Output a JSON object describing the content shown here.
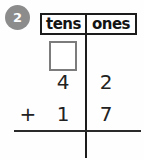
{
  "problem": {
    "number": "2",
    "operator": "+",
    "header": {
      "columns": [
        "tens",
        "ones"
      ]
    },
    "addend1": {
      "tens": "4",
      "ones": "2"
    },
    "addend2": {
      "tens": "1",
      "ones": "7"
    },
    "carry_box_value": "",
    "answer": {
      "tens": "",
      "ones": ""
    },
    "colors": {
      "badge_background": "#8c8c8c",
      "badge_text": "#ffffff",
      "line_color": "#1c1c1c",
      "carry_box_border": "#7c7c7c",
      "digit_color": "#222222"
    }
  }
}
